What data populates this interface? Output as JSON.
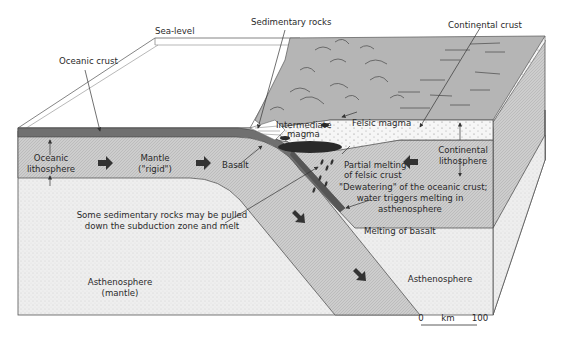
{
  "diagram": {
    "labels": {
      "sea_level": "Sea-level",
      "sedimentary_rocks": "Sedimentary rocks",
      "continental_crust": "Continental crust",
      "oceanic_crust": "Oceanic crust",
      "intermediate_magma_1": "Intermediate",
      "intermediate_magma_2": "magma",
      "felsic_magma": "Felsic magma",
      "oceanic_lithosphere_1": "Oceanic",
      "oceanic_lithosphere_2": "lithosphere",
      "mantle_1": "Mantle",
      "mantle_2": "(\"rigid\")",
      "basalt": "Basalt",
      "partial_melting_1": "Partial melting",
      "partial_melting_2": "of felsic crust",
      "continental_lithosphere_1": "Continental",
      "continental_lithosphere_2": "lithosphere",
      "dewatering_1": "\"Dewatering\" of the oceanic crust;",
      "dewatering_2": "water triggers melting in",
      "dewatering_3": "asthenosphere",
      "sed_pulled_1": "Some sedimentary rocks may be pulled",
      "sed_pulled_2": "down the subduction zone and melt",
      "melting_basalt": "Melting of basalt",
      "asthenosphere_left_1": "Asthenosphere",
      "asthenosphere_left_2": "(mantle)",
      "asthenosphere_right": "Asthenosphere"
    },
    "scale_bar": {
      "start": "0",
      "unit": "km",
      "end": "100"
    },
    "colors": {
      "oceanic_crust": "#6e6e6e",
      "lithosphere": "#c9c9c9",
      "asthenosphere": "#ececec",
      "continental_crust_top": "#b4b4b4",
      "continental_crust_section": "#f4f4f4",
      "magma": "#2a2a2a",
      "outline": "#555555"
    }
  }
}
